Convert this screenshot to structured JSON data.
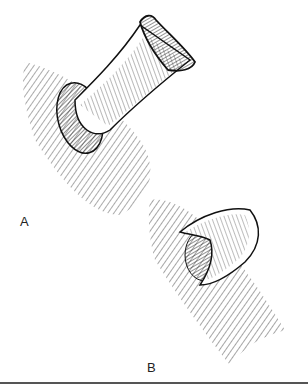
{
  "figure": {
    "panels": [
      {
        "id": "A",
        "label": "A",
        "description": "Everted tubular stoma protruding from hatched tissue surface, with flared end and surrounding cuff"
      },
      {
        "id": "B",
        "label": "B",
        "description": "Short folded stoma sutured to hatched tissue surface"
      }
    ],
    "colors": {
      "ink": "#111111",
      "background": "#ffffff",
      "rule": "#555555"
    }
  }
}
